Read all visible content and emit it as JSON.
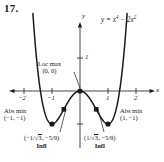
{
  "problem": {
    "number": "17."
  },
  "chart_data": {
    "type": "line",
    "title": "",
    "equation": "y = x",
    "equation_exp1": "4",
    "equation_mid": " − 2x",
    "equation_exp2": "2",
    "function": "y = x^4 - 2x^2",
    "xlabel": "x",
    "ylabel": "y",
    "xlim": [
      -2.6,
      2.6
    ],
    "ylim": [
      -1.45,
      2.35
    ],
    "grid": false,
    "legend": "none",
    "x_ticks": [
      -2,
      -1,
      1,
      2
    ],
    "x_tick_labels": [
      "−2",
      "−1",
      "1",
      "2"
    ],
    "y_ticks": [
      1
    ],
    "y_tick_labels": [
      "1"
    ],
    "points": [
      {
        "name": "local-maximum",
        "x": 0,
        "y": 0,
        "marker": "dot"
      },
      {
        "name": "absolute-minimum-left",
        "x": -1,
        "y": -1,
        "marker": "dot"
      },
      {
        "name": "absolute-minimum-right",
        "x": 1,
        "y": -1,
        "marker": "dot"
      },
      {
        "name": "inflection-left",
        "x": -0.5774,
        "y": -0.5556,
        "marker": "square"
      },
      {
        "name": "inflection-right",
        "x": 0.5774,
        "y": -0.5556,
        "marker": "square"
      }
    ]
  },
  "annotations": {
    "loc_max_label": "Loc max",
    "loc_max_point": "(0, 0)",
    "abs_min_left_label": "Abs min",
    "abs_min_left_point": "(−1, −1)",
    "abs_min_right_label": "Abs min",
    "abs_min_right_point": "(1, −1)",
    "infl_left_open": "(−1/",
    "infl_left_radicand": "3",
    "infl_left_rest": ", −5/9)",
    "infl_left_caption": "Infl",
    "infl_right_open": "(1/",
    "infl_right_radicand": "3",
    "infl_right_rest": ", −5/9)",
    "infl_right_caption": "Infl"
  },
  "axes": {
    "y_axis_name": "y",
    "x_axis_name": "x",
    "y_tick_1": "1",
    "x_tick_neg2": "−2",
    "x_tick_neg1": "−1",
    "x_tick_1": "1",
    "x_tick_2": "2"
  }
}
